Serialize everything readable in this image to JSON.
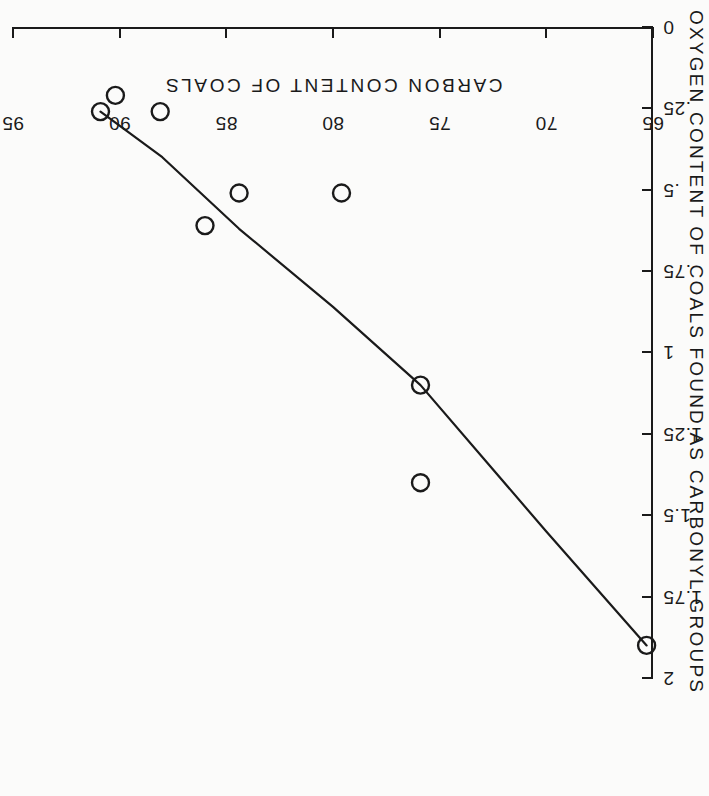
{
  "chart_data": {
    "type": "scatter",
    "title": "",
    "orientation_note": "figure printed rotated 180 degrees on the page",
    "xlabel": "CARBON CONTENT OF COALS",
    "ylabel": "OXYGEN CONTENT OF COALS FOUND AS CARBONYL GROUPS",
    "xlim": [
      65,
      95
    ],
    "ylim": [
      0,
      2
    ],
    "xticks": [
      65,
      70,
      75,
      80,
      85,
      90,
      95
    ],
    "xtick_labels": [
      "65",
      "70",
      "75",
      "80",
      "85",
      "90",
      "95"
    ],
    "yticks": [
      0,
      0.25,
      0.5,
      0.75,
      1,
      1.25,
      1.5,
      1.75,
      2
    ],
    "ytick_labels": [
      "0",
      ".25",
      ".5",
      ".75",
      "1",
      "1.25",
      "1.5",
      "1.75",
      "2"
    ],
    "grid": false,
    "legend": "none",
    "marker": "open-circle",
    "points": [
      {
        "x": 65.3,
        "y": 1.9
      },
      {
        "x": 75.9,
        "y": 1.4
      },
      {
        "x": 75.9,
        "y": 1.1
      },
      {
        "x": 79.6,
        "y": 0.51
      },
      {
        "x": 84.4,
        "y": 0.51
      },
      {
        "x": 86.0,
        "y": 0.61
      },
      {
        "x": 88.1,
        "y": 0.26
      },
      {
        "x": 90.2,
        "y": 0.21
      },
      {
        "x": 90.9,
        "y": 0.26
      }
    ],
    "series": [
      {
        "name": "measured points",
        "x": [
          65.3,
          75.9,
          75.9,
          79.6,
          84.4,
          86.0,
          88.1,
          90.2,
          90.9
        ],
        "values": [
          1.9,
          1.4,
          1.1,
          0.51,
          0.51,
          0.61,
          0.26,
          0.21,
          0.26
        ]
      },
      {
        "name": "fitted trend curve",
        "x": [
          65.3,
          70.0,
          75.9,
          80.0,
          84.4,
          88.0,
          90.9
        ],
        "values": [
          1.9,
          1.55,
          1.1,
          0.86,
          0.62,
          0.4,
          0.26
        ]
      }
    ]
  },
  "axes": {
    "x_title": "CARBON CONTENT OF COALS",
    "y_title": "OXYGEN CONTENT OF COALS FOUND AS CARBONYL GROUPS"
  }
}
